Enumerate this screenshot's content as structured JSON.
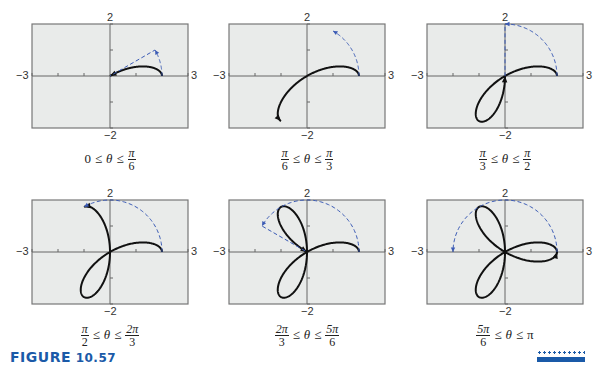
{
  "figure": {
    "label_word": "Figure",
    "label_number": "10.57",
    "accent_color": "#1a5aa8",
    "curve_color": "#111111",
    "trace_color": "#3b5bb5",
    "plot_bg": "#e9ebea"
  },
  "axes": {
    "xmin_label": "−3",
    "xmax_label": "3",
    "ymax_label": "2",
    "ymin_label": "−2"
  },
  "panels": [
    {
      "caption": {
        "lo_num": "",
        "lo_den": "",
        "lo_plain": "0",
        "hi_num": "π",
        "hi_den": "6",
        "hi_plain": "",
        "rel": "≤",
        "var": "θ"
      }
    },
    {
      "caption": {
        "lo_num": "π",
        "lo_den": "6",
        "lo_plain": "",
        "hi_num": "π",
        "hi_den": "3",
        "hi_plain": "",
        "rel": "≤",
        "var": "θ"
      }
    },
    {
      "caption": {
        "lo_num": "π",
        "lo_den": "3",
        "lo_plain": "",
        "hi_num": "π",
        "hi_den": "2",
        "hi_plain": "",
        "rel": "≤",
        "var": "θ"
      }
    },
    {
      "caption": {
        "lo_num": "π",
        "lo_den": "2",
        "lo_plain": "",
        "hi_num": "2π",
        "hi_den": "3",
        "hi_plain": "",
        "rel": "≤",
        "var": "θ"
      }
    },
    {
      "caption": {
        "lo_num": "2π",
        "lo_den": "3",
        "lo_plain": "",
        "hi_num": "5π",
        "hi_den": "6",
        "hi_plain": "",
        "rel": "≤",
        "var": "θ"
      }
    },
    {
      "caption": {
        "lo_num": "5π",
        "lo_den": "6",
        "lo_plain": "",
        "hi_num": "",
        "hi_den": "",
        "hi_plain": "π",
        "rel": "≤",
        "var": "θ"
      }
    }
  ],
  "chart_data": [
    {
      "type": "line",
      "title": "0 ≤ θ ≤ π/6",
      "equation": "r = 2cos(3θ)",
      "theta_range": [
        0,
        0.5236
      ],
      "xlim": [
        -3,
        3
      ],
      "ylim": [
        -2,
        2
      ],
      "grid": false,
      "xticks": [
        -3,
        -2,
        -1,
        0,
        1,
        2,
        3
      ],
      "yticks": [
        -2,
        -1,
        0,
        1,
        2
      ],
      "series": [
        {
          "name": "curve",
          "style": "solid"
        },
        {
          "name": "angle-trace",
          "style": "dashed"
        }
      ]
    },
    {
      "type": "line",
      "title": "π/6 ≤ θ ≤ π/3",
      "equation": "r = 2cos(3θ)",
      "theta_range": [
        0,
        1.0472
      ],
      "xlim": [
        -3,
        3
      ],
      "ylim": [
        -2,
        2
      ],
      "grid": false,
      "xticks": [
        -3,
        -2,
        -1,
        0,
        1,
        2,
        3
      ],
      "yticks": [
        -2,
        -1,
        0,
        1,
        2
      ],
      "series": [
        {
          "name": "curve",
          "style": "solid"
        },
        {
          "name": "angle-trace",
          "style": "dashed"
        }
      ]
    },
    {
      "type": "line",
      "title": "π/3 ≤ θ ≤ π/2",
      "equation": "r = 2cos(3θ)",
      "theta_range": [
        0,
        1.5708
      ],
      "xlim": [
        -3,
        3
      ],
      "ylim": [
        -2,
        2
      ],
      "grid": false,
      "xticks": [
        -3,
        -2,
        -1,
        0,
        1,
        2,
        3
      ],
      "yticks": [
        -2,
        -1,
        0,
        1,
        2
      ],
      "series": [
        {
          "name": "curve",
          "style": "solid"
        },
        {
          "name": "angle-trace",
          "style": "dashed"
        }
      ]
    },
    {
      "type": "line",
      "title": "π/2 ≤ θ ≤ 2π/3",
      "equation": "r = 2cos(3θ)",
      "theta_range": [
        0,
        2.0944
      ],
      "xlim": [
        -3,
        3
      ],
      "ylim": [
        -2,
        2
      ],
      "grid": false,
      "xticks": [
        -3,
        -2,
        -1,
        0,
        1,
        2,
        3
      ],
      "yticks": [
        -2,
        -1,
        0,
        1,
        2
      ],
      "series": [
        {
          "name": "curve",
          "style": "solid"
        },
        {
          "name": "angle-trace",
          "style": "dashed"
        }
      ]
    },
    {
      "type": "line",
      "title": "2π/3 ≤ θ ≤ 5π/6",
      "equation": "r = 2cos(3θ)",
      "theta_range": [
        0,
        2.618
      ],
      "xlim": [
        -3,
        3
      ],
      "ylim": [
        -2,
        2
      ],
      "grid": false,
      "xticks": [
        -3,
        -2,
        -1,
        0,
        1,
        2,
        3
      ],
      "yticks": [
        -2,
        -1,
        0,
        1,
        2
      ],
      "series": [
        {
          "name": "curve",
          "style": "solid"
        },
        {
          "name": "angle-trace",
          "style": "dashed"
        }
      ]
    },
    {
      "type": "line",
      "title": "5π/6 ≤ θ ≤ π",
      "equation": "r = 2cos(3θ)",
      "theta_range": [
        0,
        3.1416
      ],
      "xlim": [
        -3,
        3
      ],
      "ylim": [
        -2,
        2
      ],
      "grid": false,
      "xticks": [
        -3,
        -2,
        -1,
        0,
        1,
        2,
        3
      ],
      "yticks": [
        -2,
        -1,
        0,
        1,
        2
      ],
      "series": [
        {
          "name": "curve",
          "style": "solid"
        },
        {
          "name": "angle-trace",
          "style": "dashed"
        }
      ]
    }
  ]
}
